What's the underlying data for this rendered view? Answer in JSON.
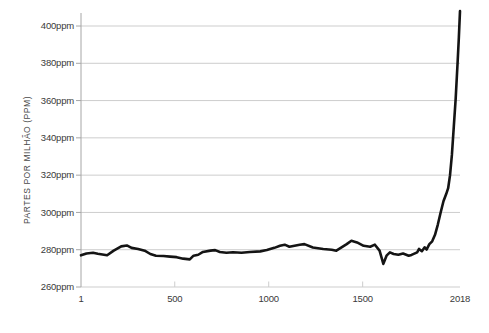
{
  "chart": {
    "y_axis_label": "PARTES POR MILHÃO (PPM)"
  },
  "chart_data": {
    "type": "line",
    "title": "",
    "xlabel": "",
    "ylabel": "PARTES POR MILHÃO (PPM)",
    "xlim": [
      1,
      2018
    ],
    "ylim": [
      260,
      400
    ],
    "grid": "horizontal",
    "legend": "none",
    "x_tick_values": [
      1,
      500,
      1000,
      1500,
      2018
    ],
    "x_tick_labels": [
      "1",
      "500",
      "1000",
      "1500",
      "2018"
    ],
    "x_minor_tick_years": [
      500,
      1000,
      1500
    ],
    "y_tick_values": [
      260,
      280,
      300,
      320,
      340,
      360,
      380,
      400
    ],
    "y_tick_labels": [
      "260ppm",
      "280ppm",
      "300ppm",
      "320ppm",
      "340ppm",
      "360ppm",
      "380ppm",
      "400ppm"
    ],
    "colors": {
      "line": "#141414",
      "grid": "#cdcdcd",
      "axis": "#a6a6a6",
      "tick_label": "#3a3a3a"
    },
    "series": [
      {
        "name": "co2_ppm",
        "x": [
          1,
          30,
          65,
          90,
          140,
          175,
          215,
          245,
          270,
          305,
          340,
          370,
          400,
          440,
          475,
          510,
          545,
          580,
          600,
          625,
          650,
          690,
          715,
          740,
          775,
          810,
          855,
          900,
          955,
          990,
          1030,
          1060,
          1085,
          1110,
          1165,
          1190,
          1235,
          1290,
          1335,
          1360,
          1415,
          1440,
          1470,
          1505,
          1540,
          1565,
          1590,
          1610,
          1627,
          1645,
          1665,
          1690,
          1715,
          1745,
          1760,
          1790,
          1800,
          1815,
          1830,
          1840,
          1855,
          1870,
          1885,
          1900,
          1915,
          1930,
          1945,
          1955,
          1965,
          1975,
          1985,
          1995,
          2005,
          2012,
          2018
        ],
        "y": [
          277,
          278,
          278.4,
          277.8,
          277,
          279.5,
          281.8,
          282.3,
          281,
          280.4,
          279.5,
          277.7,
          276.8,
          276.6,
          276.3,
          276,
          275.2,
          274.8,
          276.8,
          277.3,
          278.8,
          279.5,
          279.8,
          278.8,
          278.4,
          278.6,
          278.4,
          278.8,
          279.1,
          279.8,
          281,
          282.1,
          282.7,
          281.6,
          282.7,
          283,
          281.2,
          280.4,
          280,
          279.5,
          283,
          284.8,
          283.9,
          282.1,
          281.6,
          282.7,
          279.5,
          272.4,
          276.8,
          278.6,
          277.7,
          277.3,
          278,
          276.8,
          277.2,
          278.6,
          280.4,
          279.2,
          281.3,
          280.1,
          283,
          284.5,
          288,
          293.5,
          300,
          306,
          310,
          313,
          320,
          331,
          346,
          361,
          380,
          394,
          408
        ]
      }
    ]
  }
}
